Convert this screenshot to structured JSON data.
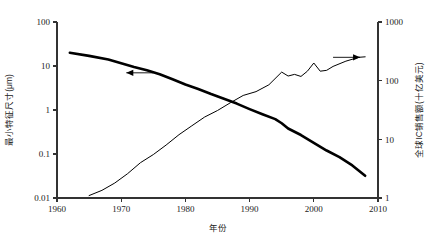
{
  "chart_data": {
    "type": "line",
    "title": "",
    "xlabel": "年份",
    "ylabel": "最小特征尺寸(μm)",
    "y2label": "全球IC销售额(十亿美元)",
    "xlim": [
      1960,
      2010
    ],
    "ylim": [
      0.01,
      100
    ],
    "y2lim": [
      1,
      1000
    ],
    "yscale": "log",
    "y2scale": "log",
    "grid": false,
    "legend": "none",
    "xticks": [
      "1960",
      "1970",
      "1980",
      "1990",
      "2000",
      "2010"
    ],
    "xtick_values": [
      1960,
      1970,
      1980,
      1990,
      2000,
      2010
    ],
    "yticks": [
      "100",
      "10",
      "1",
      "0.1",
      "0.01"
    ],
    "ytick_values": [
      100,
      10,
      1,
      0.1,
      0.01
    ],
    "y2ticks": [
      "1000",
      "100",
      "10",
      "1"
    ],
    "y2tick_values": [
      1000,
      100,
      10,
      1
    ],
    "annotations": [
      {
        "name": "left-axis-arrow",
        "text": "",
        "points_to": "left",
        "x": 1975,
        "y": 7.0
      },
      {
        "name": "right-axis-arrow",
        "text": "",
        "points_to": "right",
        "x": 2003,
        "y2": 250
      }
    ],
    "series": [
      {
        "name": "最小特征尺寸(μm)",
        "axis": "left",
        "style": "thick",
        "color": "#000000",
        "x": [
          1962,
          1965,
          1968,
          1970,
          1972,
          1974,
          1976,
          1978,
          1980,
          1982,
          1984,
          1986,
          1988,
          1990,
          1992,
          1994,
          1995,
          1996,
          1998,
          2000,
          2002,
          2004,
          2006,
          2008
        ],
        "y": [
          20,
          17,
          14,
          11.5,
          9.5,
          8.0,
          6.5,
          5.0,
          3.8,
          3.0,
          2.3,
          1.8,
          1.4,
          1.05,
          0.8,
          0.62,
          0.5,
          0.38,
          0.27,
          0.18,
          0.12,
          0.085,
          0.055,
          0.032
        ]
      },
      {
        "name": "全球IC销售额(十亿美元)",
        "axis": "right",
        "style": "thin",
        "color": "#000000",
        "x": [
          1965,
          1967,
          1969,
          1971,
          1973,
          1975,
          1977,
          1979,
          1981,
          1983,
          1985,
          1987,
          1989,
          1991,
          1993,
          1995,
          1996,
          1997,
          1998,
          1999,
          2000,
          2001,
          2002,
          2003,
          2005,
          2007,
          2008
        ],
        "y": [
          1.1,
          1.35,
          1.8,
          2.6,
          4.0,
          5.5,
          8.0,
          12,
          17,
          24,
          31,
          42,
          56,
          65,
          85,
          140,
          120,
          128,
          118,
          145,
          200,
          145,
          150,
          175,
          215,
          250,
          255
        ]
      }
    ]
  }
}
